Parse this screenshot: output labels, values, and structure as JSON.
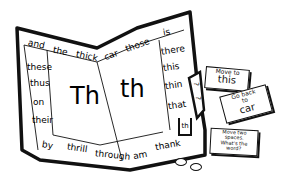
{
  "board": {
    "top_row": [
      "and",
      "the",
      "thick",
      "car",
      "those",
      "is"
    ],
    "left_column": [
      "these",
      "thus",
      "on",
      "their"
    ],
    "right_column": [
      "there",
      "this",
      "thin",
      "that"
    ],
    "bottom_row": [
      "by",
      "thrill",
      "through",
      "am",
      "thank"
    ],
    "start_space": "th",
    "center_left": "Th",
    "center_right": "th",
    "tab_marks": [
      "?",
      "?"
    ]
  },
  "cards": [
    {
      "line1": "Move to",
      "line2": "this"
    },
    {
      "line1": "Go back",
      "line2": "to",
      "line3": "car"
    },
    {
      "line1": "Move two",
      "line2": "spaces.",
      "line3": "What's the",
      "line4": "word?"
    }
  ],
  "pieces": {
    "count": 2,
    "color": "#ffffff"
  }
}
